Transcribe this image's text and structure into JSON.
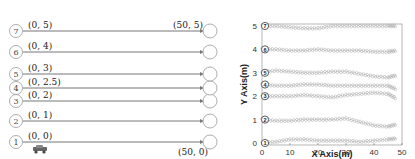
{
  "diagram": {
    "lanes": [
      {
        "id": "1",
        "start_label": "(0, 0)",
        "y": 0
      },
      {
        "id": "2",
        "start_label": "(0, 1)",
        "y": 1
      },
      {
        "id": "3",
        "start_label": "(0, 2)",
        "y": 2
      },
      {
        "id": "4",
        "start_label": "(0, 2.5)",
        "y": 2.5
      },
      {
        "id": "5",
        "start_label": "(0, 3)",
        "y": 3
      },
      {
        "id": "6",
        "start_label": "(0, 4)",
        "y": 4
      },
      {
        "id": "7",
        "start_label": "(0, 5)",
        "y": 5
      }
    ],
    "end_label_top": "(50, 5)",
    "end_label_bottom": "(50, 0)",
    "vehicle_icon": "car-icon"
  },
  "chart_data": {
    "type": "scatter",
    "title": "",
    "xlabel": "X Axis(m)",
    "ylabel": "Y Axis(m)",
    "xlim": [
      0,
      50
    ],
    "ylim": [
      0,
      5
    ],
    "xticks": [
      "0",
      "10",
      "20",
      "30",
      "40",
      "50"
    ],
    "yticks": [
      "0",
      "1",
      "2",
      "3",
      "4",
      "5"
    ],
    "grid": false,
    "series": [
      {
        "name": "1",
        "x": [
          0,
          5,
          10,
          15,
          20,
          25,
          30,
          35,
          40,
          45,
          48
        ],
        "y": [
          0,
          0.05,
          0.15,
          0.15,
          0.1,
          0.1,
          0.1,
          0.05,
          0.1,
          0.15,
          0.2
        ]
      },
      {
        "name": "2",
        "x": [
          0,
          5,
          10,
          15,
          20,
          25,
          30,
          35,
          40,
          45,
          48
        ],
        "y": [
          1,
          0.95,
          0.95,
          1.0,
          1.0,
          1.0,
          1.05,
          0.9,
          0.75,
          0.7,
          0.8
        ]
      },
      {
        "name": "3",
        "x": [
          0,
          5,
          10,
          15,
          20,
          25,
          30,
          35,
          40,
          45,
          48
        ],
        "y": [
          2,
          2.0,
          2.0,
          2.05,
          2.0,
          1.95,
          2.05,
          2.1,
          2.15,
          2.1,
          1.9
        ]
      },
      {
        "name": "4",
        "x": [
          0,
          5,
          10,
          15,
          20,
          25,
          30,
          35,
          40,
          45,
          48
        ],
        "y": [
          2.5,
          2.45,
          2.45,
          2.5,
          2.5,
          2.45,
          2.45,
          2.45,
          2.45,
          2.45,
          2.3
        ]
      },
      {
        "name": "5",
        "x": [
          0,
          5,
          10,
          15,
          20,
          25,
          30,
          35,
          40,
          45,
          48
        ],
        "y": [
          3,
          3.1,
          3.05,
          3.0,
          3.0,
          3.05,
          3.05,
          2.95,
          2.85,
          2.8,
          2.9
        ]
      },
      {
        "name": "6",
        "x": [
          0,
          5,
          10,
          15,
          20,
          25,
          30,
          35,
          40,
          45,
          48
        ],
        "y": [
          4,
          4.0,
          3.95,
          3.95,
          4.0,
          3.95,
          3.95,
          3.95,
          3.9,
          3.9,
          3.95
        ]
      },
      {
        "name": "7",
        "x": [
          0,
          5,
          10,
          15,
          20,
          25,
          30,
          35,
          40,
          45,
          48
        ],
        "y": [
          5,
          5.0,
          4.95,
          4.9,
          4.9,
          5.0,
          5.0,
          5.0,
          5.0,
          5.0,
          5.0
        ]
      }
    ]
  }
}
